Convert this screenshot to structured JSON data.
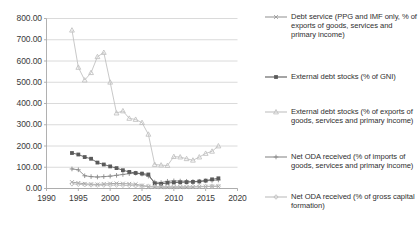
{
  "chart_data": {
    "type": "line",
    "title": "",
    "xlabel": "",
    "ylabel": "",
    "xlim": [
      1990,
      2020
    ],
    "ylim": [
      0,
      800
    ],
    "xticks": [
      "1990",
      "1995",
      "2000",
      "2005",
      "2010",
      "2015",
      "2020"
    ],
    "yticks": [
      "0.00",
      "100.00",
      "200.00",
      "300.00",
      "400.00",
      "500.00",
      "600.00",
      "700.00",
      "800.00"
    ],
    "grid": "horizontal",
    "legend_position": "right",
    "x": [
      1994,
      1995,
      1996,
      1997,
      1998,
      1999,
      2000,
      2001,
      2002,
      2003,
      2004,
      2005,
      2006,
      2007,
      2008,
      2009,
      2010,
      2011,
      2012,
      2013,
      2014,
      2015,
      2016,
      2017
    ],
    "series": [
      {
        "name": "Debt service (PPG and IMF only, % of exports of goods, services and primary income)",
        "marker": "cross",
        "color": "#9a9a9a",
        "values": [
          30,
          26,
          22,
          20,
          19,
          21,
          23,
          24,
          23,
          22,
          20,
          14,
          8,
          7,
          6,
          6,
          6,
          6,
          6,
          7,
          8,
          9,
          10,
          10
        ]
      },
      {
        "name": "External debt stocks (% of GNI)",
        "marker": "square",
        "color": "#5a5a5a",
        "values": [
          167,
          160,
          148,
          140,
          122,
          113,
          104,
          96,
          86,
          78,
          73,
          70,
          66,
          24,
          22,
          26,
          28,
          29,
          30,
          31,
          33,
          37,
          43,
          48
        ]
      },
      {
        "name": "External debt stocks (% of exports of goods, services and primary income)",
        "marker": "triangle",
        "color": "#c2c2c2",
        "values": [
          745,
          570,
          510,
          545,
          620,
          640,
          500,
          355,
          365,
          330,
          325,
          310,
          255,
          113,
          110,
          108,
          150,
          148,
          140,
          133,
          148,
          165,
          175,
          200
        ]
      },
      {
        "name": "Net ODA received (% of imports of goods, services and primary income)",
        "marker": "cross-bar",
        "color": "#8a8a8a",
        "values": [
          92,
          88,
          60,
          56,
          54,
          56,
          58,
          62,
          66,
          70,
          72,
          68,
          58,
          30,
          28,
          34,
          36,
          35,
          34,
          33,
          34,
          36,
          38,
          40
        ]
      },
      {
        "name": "Net ODA received (% of gross capital formation)",
        "marker": "diamond",
        "color": "#bdbdbd",
        "values": [
          22,
          20,
          18,
          17,
          16,
          16,
          16,
          16,
          15,
          14,
          13,
          12,
          11,
          9,
          9,
          10,
          10,
          10,
          10,
          10,
          10,
          10,
          11,
          11
        ]
      }
    ]
  },
  "legend": {
    "items": [
      {
        "label": "Debt service (PPG and IMF only, % of exports of goods, services and primary income)",
        "marker": "cross",
        "color": "#9a9a9a"
      },
      {
        "label": "External debt stocks (% of GNI)",
        "marker": "square",
        "color": "#5a5a5a"
      },
      {
        "label": "External debt stocks (% of exports of goods, services and primary income)",
        "marker": "triangle",
        "color": "#c2c2c2"
      },
      {
        "label": "Net ODA received (% of imports of goods, services and primary income)",
        "marker": "cross-bar",
        "color": "#8a8a8a"
      },
      {
        "label": "Net ODA received (% of gross capital formation)",
        "marker": "diamond",
        "color": "#bdbdbd"
      }
    ]
  },
  "style": {
    "grid_color": "#d0d0d0",
    "axis_color": "#a8a8a8",
    "text_color": "#2f2f2f",
    "background": "#ffffff"
  }
}
